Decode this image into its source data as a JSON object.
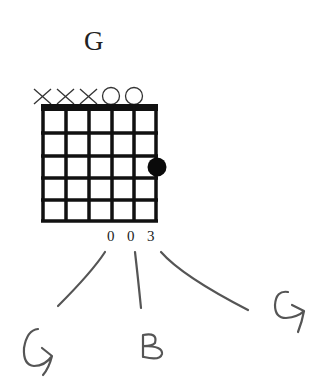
{
  "chord": {
    "name": "G",
    "string_markers": [
      "X",
      "X",
      "X",
      "O",
      "O",
      ""
    ],
    "fret_numbers_below": [
      "",
      "",
      "",
      "0",
      "0",
      "3"
    ],
    "frets_shown": 5,
    "strings": 6,
    "fingered_dots": [
      {
        "string": 6,
        "fret": 3
      }
    ]
  },
  "annotations": {
    "notes": [
      {
        "label": "G",
        "from_fret_label": "0"
      },
      {
        "label": "B",
        "from_fret_label": "0"
      },
      {
        "label": "G",
        "from_fret_label": "3"
      }
    ]
  },
  "colors": {
    "ink": "#111111",
    "pencil": "#555555"
  }
}
